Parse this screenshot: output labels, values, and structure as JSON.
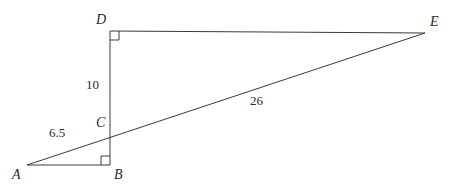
{
  "figure": {
    "type": "geometry-diagram",
    "background_color": "#ffffff",
    "stroke_color": "#3a3a3a",
    "label_color": "#2b2b2b",
    "points": [
      {
        "name": "A",
        "label": "A",
        "x": 27,
        "y": 165,
        "label_x": 12,
        "label_y": 168
      },
      {
        "name": "B",
        "label": "B",
        "x": 110,
        "y": 165,
        "label_x": 114,
        "label_y": 168
      },
      {
        "name": "C",
        "label": "C",
        "x": 110,
        "y": 131,
        "label_x": 96,
        "label_y": 116
      },
      {
        "name": "D",
        "label": "D",
        "x": 110,
        "y": 31,
        "label_x": 96,
        "label_y": 13
      },
      {
        "name": "E",
        "label": "E",
        "x": 425,
        "y": 33,
        "label_x": 430,
        "label_y": 15
      }
    ],
    "segments": [
      {
        "name": "segment-AB",
        "from": "A",
        "to": "B"
      },
      {
        "name": "segment-DB",
        "from": "D",
        "to": "B"
      },
      {
        "name": "segment-DE",
        "from": "D",
        "to": "E"
      },
      {
        "name": "segment-AE",
        "from": "A",
        "to": "E"
      }
    ],
    "right_angles": [
      {
        "name": "right-angle-at-D",
        "vertex": "D",
        "size": 9,
        "dir_x": 1,
        "dir_y": 1
      },
      {
        "name": "right-angle-at-B",
        "vertex": "B",
        "size": 9,
        "dir_x": -1,
        "dir_y": -1
      }
    ],
    "measures": [
      {
        "name": "measure-DC",
        "text": "10",
        "x": 86,
        "y": 78,
        "segment": "D-C"
      },
      {
        "name": "measure-AC",
        "text": "6.5",
        "x": 49,
        "y": 126,
        "segment": "A-C"
      },
      {
        "name": "measure-CE",
        "text": "26",
        "x": 250,
        "y": 94,
        "segment": "C-E"
      }
    ]
  }
}
